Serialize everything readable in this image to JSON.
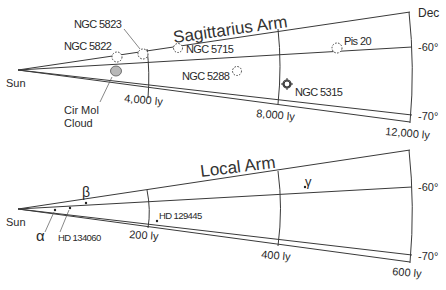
{
  "axis": {
    "dec_label": "Dec",
    "dec_ticks": [
      "-60°",
      "-70°"
    ]
  },
  "sagittarius": {
    "title": "Sagittarius Arm",
    "origin_label": "Sun",
    "distance_labels": [
      "4,000 ly",
      "8,000 ly",
      "12,000 ly"
    ],
    "objects": [
      {
        "name": "NGC 5823",
        "symbol": "open-cluster-dotted-circle"
      },
      {
        "name": "NGC 5822",
        "symbol": "open-cluster-dotted-circle"
      },
      {
        "name": "NGC 5715",
        "symbol": "open-cluster-dotted-circle"
      },
      {
        "name": "NGC 5288",
        "symbol": "open-cluster-dotted-circle"
      },
      {
        "name": "Pis 20",
        "symbol": "open-cluster-dotted-circle"
      },
      {
        "name": "NGC 5315",
        "symbol": "planetary-nebula-crosshair"
      },
      {
        "name": "Cir Mol Cloud",
        "name_line1": "Cir Mol",
        "name_line2": "Cloud",
        "symbol": "filled-grey-ellipse"
      }
    ]
  },
  "local": {
    "title": "Local Arm",
    "origin_label": "Sun",
    "distance_labels": [
      "200 ly",
      "400 ly",
      "600 ly"
    ],
    "stars": [
      {
        "name": "α"
      },
      {
        "name": "β"
      },
      {
        "name": "γ"
      },
      {
        "name": "HD 134060"
      },
      {
        "name": "HD 129445"
      }
    ]
  },
  "colors": {
    "line": "#3a3a3a",
    "text": "#2a2a2a",
    "cloud_fill": "#b8b8b8",
    "background": "#ffffff"
  }
}
